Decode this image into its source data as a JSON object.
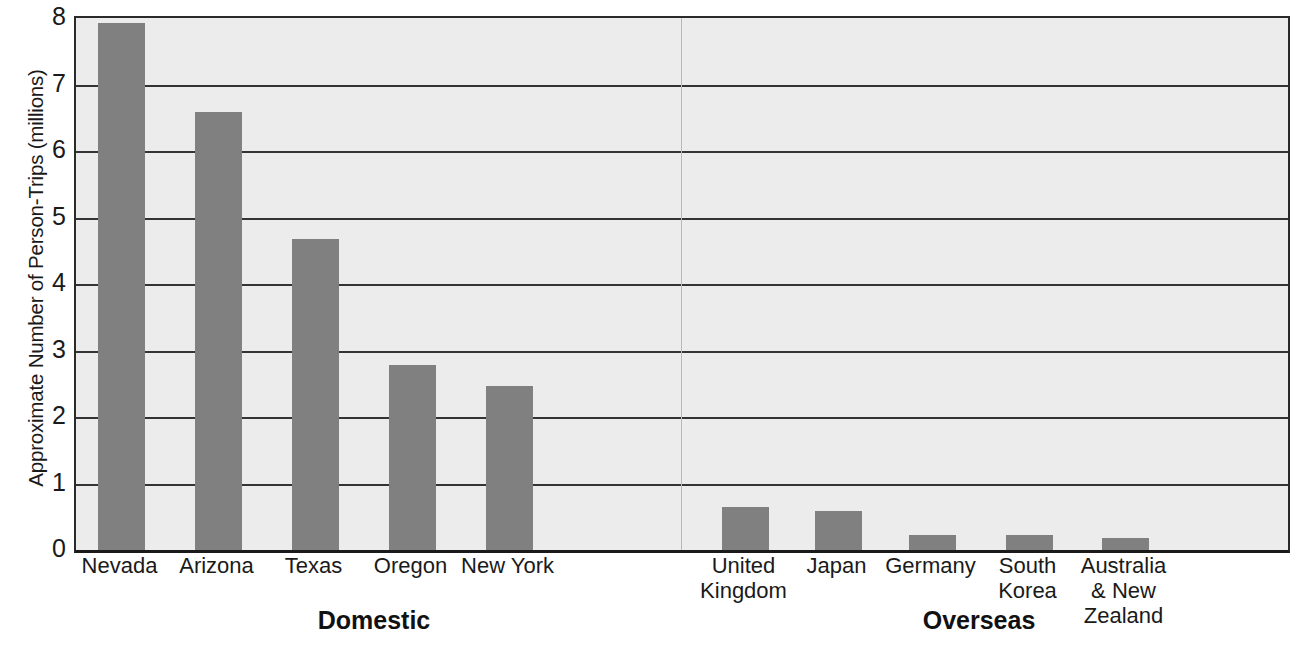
{
  "chart_data": {
    "type": "bar",
    "title": "",
    "xlabel": "",
    "ylabel": "Approximate Number of Person-Trips (millions)",
    "ylim": [
      0,
      8
    ],
    "ytick_labels": [
      "8",
      "7",
      "6",
      "5",
      "4",
      "3",
      "2",
      "1",
      "0"
    ],
    "ytick_values": [
      8,
      7,
      6,
      5,
      4,
      3,
      2,
      1,
      0
    ],
    "grid": true,
    "legend": "none",
    "bar_color": "#808080",
    "plot_background": "#ececec",
    "gridline_color": "#333333",
    "categories": [
      "Nevada",
      "Arizona",
      "Texas",
      "Oregon",
      "New York",
      "United Kingdom",
      "Japan",
      "Germany",
      "South Korea",
      "Australia & New Zealand"
    ],
    "values": [
      7.92,
      6.58,
      4.68,
      2.78,
      2.47,
      0.65,
      0.58,
      0.22,
      0.22,
      0.18
    ],
    "groups": [
      {
        "label": "Domestic",
        "categories": [
          "Nevada",
          "Arizona",
          "Texas",
          "Oregon",
          "New York"
        ],
        "values": [
          7.92,
          6.58,
          4.68,
          2.78,
          2.47
        ]
      },
      {
        "label": "Overseas",
        "categories": [
          "United Kingdom",
          "Japan",
          "Germany",
          "South Korea",
          "Australia & New Zealand"
        ],
        "values": [
          0.65,
          0.58,
          0.22,
          0.22,
          0.18
        ]
      }
    ]
  },
  "axis": {
    "y_title": "Approximate Number of Person-Trips (millions)"
  },
  "category_labels": [
    {
      "line1": "Nevada",
      "line2": "",
      "line3": ""
    },
    {
      "line1": "Arizona",
      "line2": "",
      "line3": ""
    },
    {
      "line1": "Texas",
      "line2": "",
      "line3": ""
    },
    {
      "line1": "Oregon",
      "line2": "",
      "line3": ""
    },
    {
      "line1": "New York",
      "line2": "",
      "line3": ""
    },
    {
      "line1": "United",
      "line2": "Kingdom",
      "line3": ""
    },
    {
      "line1": "Japan",
      "line2": "",
      "line3": ""
    },
    {
      "line1": "Germany",
      "line2": "",
      "line3": ""
    },
    {
      "line1": "South",
      "line2": "Korea",
      "line3": ""
    },
    {
      "line1": "Australia",
      "line2": "& New",
      "line3": "Zealand"
    }
  ],
  "group_labels": [
    {
      "text": "Domestic"
    },
    {
      "text": "Overseas"
    }
  ]
}
